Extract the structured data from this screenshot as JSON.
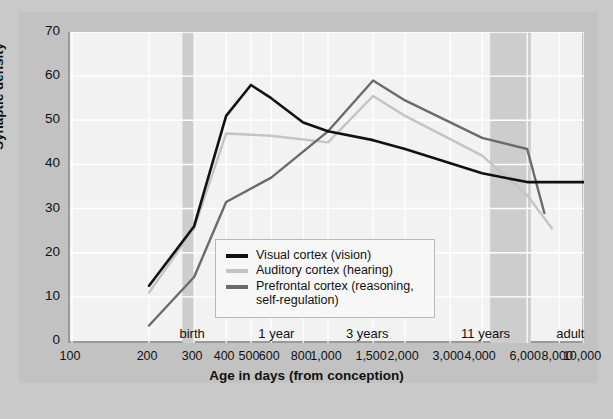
{
  "chart_data": {
    "type": "line",
    "title": "",
    "xlabel": "Age in days (from conception)",
    "ylabel": "Synaptic density",
    "xscale": "log",
    "xlim": [
      100,
      10000
    ],
    "ylim": [
      0,
      70
    ],
    "yticks": [
      0,
      10,
      20,
      30,
      40,
      50,
      60,
      70
    ],
    "xticks": [
      100,
      200,
      300,
      400,
      500,
      600,
      800,
      1000,
      1500,
      2000,
      3000,
      4000,
      6000,
      8000,
      10000
    ],
    "xticklabels": [
      "100",
      "200",
      "300",
      "400",
      "500",
      "600",
      "800",
      "1,000",
      "1,500",
      "2,000",
      "3,000",
      "4,000",
      "6,000",
      "8,000",
      "10,000"
    ],
    "grid": true,
    "legend_position": "center-left",
    "series": [
      {
        "name": "Visual cortex (vision)",
        "color": "#111111",
        "x": [
          200,
          300,
          400,
          500,
          600,
          800,
          1000,
          1500,
          2000,
          4000,
          6000,
          10000
        ],
        "y": [
          12.5,
          26,
          51,
          58,
          55,
          49.5,
          47.5,
          45.5,
          43.5,
          38,
          36,
          36
        ]
      },
      {
        "name": "Auditory cortex (hearing)",
        "color": "#c4c4c4",
        "x": [
          200,
          300,
          400,
          600,
          1000,
          1500,
          2000,
          4000,
          6000,
          7500
        ],
        "y": [
          11,
          25.5,
          47,
          46.5,
          45,
          55.5,
          51,
          42,
          33,
          25.5
        ]
      },
      {
        "name": "Prefrontal cortex (reasoning, self-regulation)",
        "color": "#6b6b6b",
        "x": [
          200,
          300,
          400,
          600,
          1000,
          1500,
          2000,
          4000,
          6000,
          7000
        ],
        "y": [
          3.5,
          14.5,
          31.5,
          37,
          47.5,
          59,
          54.5,
          46,
          43.5,
          29
        ]
      }
    ],
    "period_bands": [
      {
        "label": "Newborn",
        "x_start": 100,
        "x_end": 278,
        "shaded": false
      },
      {
        "label": "Adolescence",
        "x_start": 2750,
        "x_end": 10000,
        "shaded": false
      }
    ],
    "shaded_bands": [
      {
        "x_start": 270,
        "x_end": 300
      },
      {
        "x_start": 4300,
        "x_end": 6200
      }
    ],
    "stage_markers": [
      {
        "label": "birth",
        "x": 300
      },
      {
        "label": "1 year",
        "x": 640
      },
      {
        "label": "3 years",
        "x": 1450
      },
      {
        "label": "11 years",
        "x": 4200
      },
      {
        "label": "adult",
        "x": 9000
      }
    ]
  },
  "colors": {
    "background": "#c9c9c9",
    "card": "#c2c2c2",
    "panel": "#f2f2f2",
    "grid": "#ffffff",
    "axis": "#9a9a9a",
    "band": "#cdcdcd",
    "visual": "#111111",
    "auditory": "#c4c4c4",
    "prefrontal": "#6b6b6b"
  }
}
